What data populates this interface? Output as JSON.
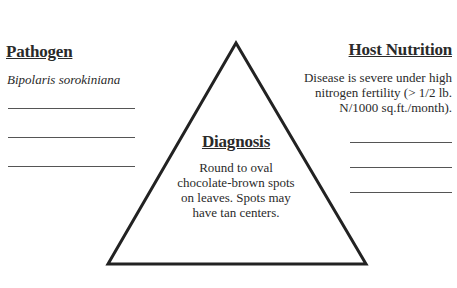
{
  "pathogen": {
    "heading": "Pathogen",
    "organism": "Bipolaris sorokiniana",
    "blank_lines": 3
  },
  "host_nutrition": {
    "heading": "Host Nutrition",
    "lines": [
      "Disease is severe under high",
      "nitrogen fertility (> 1/2 lb.",
      "N/1000 sq.ft./month)."
    ],
    "blank_lines": 3
  },
  "diagnosis": {
    "heading": "Diagnosis",
    "lines": [
      "Round to oval",
      "chocolate-brown spots",
      "on leaves.  Spots may",
      "have tan centers."
    ]
  },
  "colors": {
    "ink": "#2a2a2a",
    "background": "#ffffff"
  }
}
